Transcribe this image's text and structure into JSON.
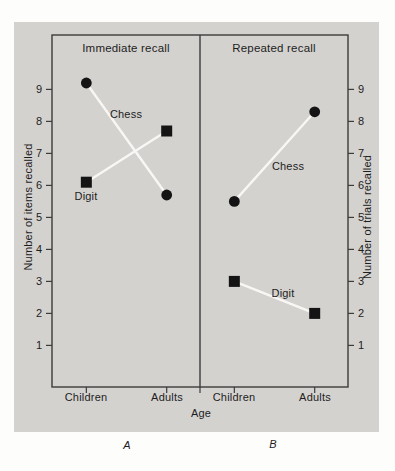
{
  "colors": {
    "page_bg": "#fdfdfc",
    "panel_bg": "#d4d2cf",
    "frame": "#3b3b3b",
    "marker": "#141414",
    "series_line": "#f8f7f5",
    "text": "#1d1d1d"
  },
  "chart_data": {
    "type": "line",
    "xlabel": "Age",
    "ylabel_left": "Number of items recalled",
    "ylabel_right": "Number of trials recalled",
    "yticks": [
      1,
      2,
      3,
      4,
      5,
      6,
      7,
      8,
      9
    ],
    "ylim": [
      -0.3,
      10.7
    ],
    "grid": false,
    "legend": "in-plot series labels",
    "panels": [
      {
        "letter": "A",
        "title": "Immediate recall",
        "categories": [
          "Children",
          "Adults"
        ],
        "series": [
          {
            "name": "Chess",
            "marker": "circle",
            "values": [
              9.2,
              5.7
            ]
          },
          {
            "name": "Digit",
            "marker": "square",
            "values": [
              6.1,
              7.7
            ]
          }
        ]
      },
      {
        "letter": "B",
        "title": "Repeated recall",
        "categories": [
          "Children",
          "Adults"
        ],
        "series": [
          {
            "name": "Chess",
            "marker": "circle",
            "values": [
              5.5,
              8.3
            ]
          },
          {
            "name": "Digit",
            "marker": "square",
            "values": [
              3.0,
              2.0
            ]
          }
        ]
      }
    ]
  }
}
